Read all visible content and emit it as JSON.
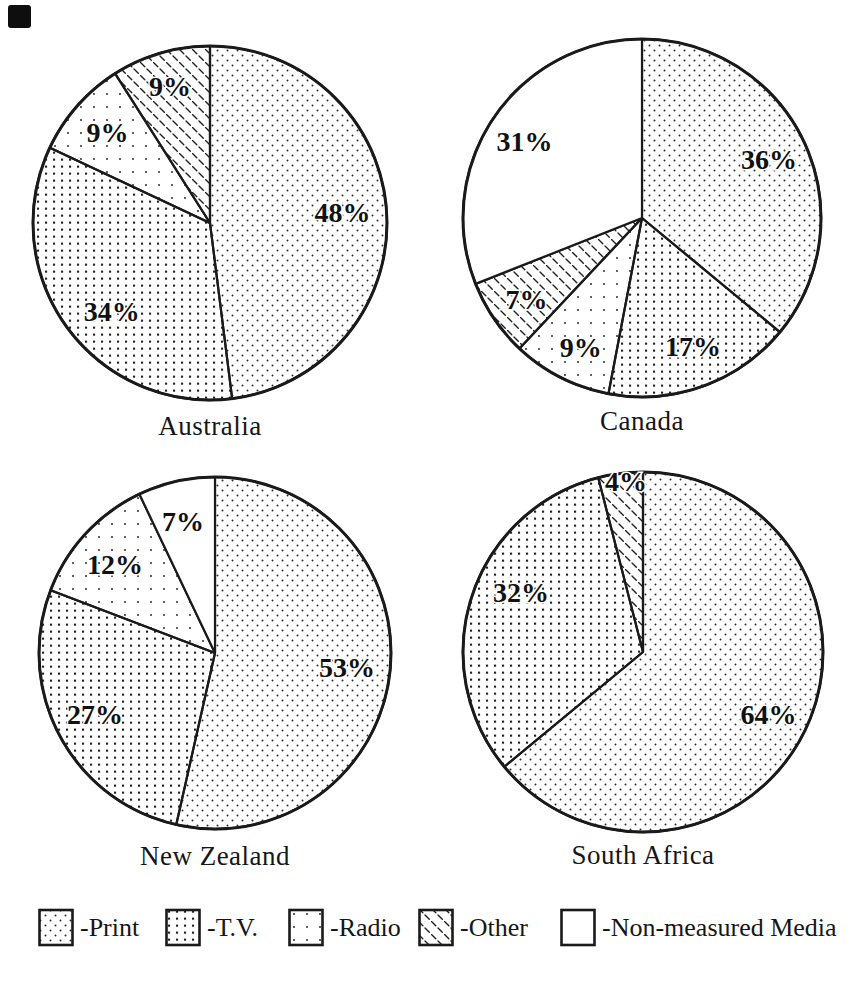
{
  "page": {
    "background": "#ffffff",
    "ink": "#1a1a1a"
  },
  "legend": {
    "items": [
      {
        "key": "print",
        "label": "-Print"
      },
      {
        "key": "tv",
        "label": "-T.V."
      },
      {
        "key": "radio",
        "label": "-Radio"
      },
      {
        "key": "other",
        "label": "-Other"
      },
      {
        "key": "nonmeasured",
        "label": "-Non-measured Media"
      }
    ]
  },
  "chart_data": [
    {
      "type": "pie",
      "title": "Australia",
      "start_angle_deg": 0,
      "direction": "clockwise",
      "layout": {
        "radius": 177
      },
      "slices": [
        {
          "series": "Print",
          "pattern": "print",
          "label": "48%",
          "value": 48,
          "label_angle": 85.7,
          "label_r": 0.75
        },
        {
          "series": "T.V.",
          "pattern": "tv",
          "label": "34%",
          "value": 34,
          "label_angle": 227.8,
          "label_r": 0.75
        },
        {
          "series": "Radio",
          "pattern": "radio",
          "label": "9%",
          "value": 9,
          "label_angle": 311.2,
          "label_r": 0.77
        },
        {
          "series": "Other",
          "pattern": "other",
          "label": "9%",
          "value": 9,
          "label_angle": 343.6,
          "label_r": 0.8
        }
      ]
    },
    {
      "type": "pie",
      "title": "Canada",
      "start_angle_deg": 0,
      "direction": "clockwise",
      "layout": {
        "radius": 179
      },
      "slices": [
        {
          "series": "Print",
          "pattern": "print",
          "label": "36%",
          "value": 36,
          "label_angle": 65.5,
          "label_r": 0.78
        },
        {
          "series": "T.V.",
          "pattern": "tv",
          "label": "17%",
          "value": 17,
          "label_angle": 158.4,
          "label_r": 0.775
        },
        {
          "series": "Radio",
          "pattern": "radio",
          "label": "9%",
          "value": 9,
          "label_angle": 205.3,
          "label_r": 0.8
        },
        {
          "series": "Other",
          "pattern": "other",
          "label": "7%",
          "value": 7,
          "label_angle": 234.7,
          "label_r": 0.79
        },
        {
          "series": "Non-measured Media",
          "pattern": "nonmeasured",
          "label": "31%",
          "value": 31,
          "label_angle": 302.8,
          "label_r": 0.78
        }
      ]
    },
    {
      "type": "pie",
      "title": "New Zealand",
      "start_angle_deg": 0,
      "direction": "clockwise",
      "layout": {
        "radius": 176
      },
      "slices": [
        {
          "series": "Print",
          "pattern": "print",
          "label": "53%",
          "value": 53,
          "label_angle": 96.5,
          "label_r": 0.755
        },
        {
          "series": "T.V.",
          "pattern": "tv",
          "label": "27%",
          "value": 27,
          "label_angle": 242.7,
          "label_r": 0.767
        },
        {
          "series": "Radio",
          "pattern": "radio",
          "label": "12%",
          "value": 12,
          "label_angle": 311.3,
          "label_r": 0.757
        },
        {
          "series": "Non-measured Media",
          "pattern": "nonmeasured",
          "label": "7%",
          "value": 7,
          "label_angle": 346.3,
          "label_r": 0.766
        }
      ]
    },
    {
      "type": "pie",
      "title": "South Africa",
      "start_angle_deg": 0,
      "direction": "clockwise",
      "layout": {
        "radius": 180
      },
      "slices": [
        {
          "series": "Print",
          "pattern": "print",
          "label": "64%",
          "value": 64,
          "label_angle": 116.6,
          "label_r": 0.78
        },
        {
          "series": "T.V.",
          "pattern": "tv",
          "label": "32%",
          "value": 32,
          "label_angle": 295.8,
          "label_r": 0.753
        },
        {
          "series": "Other",
          "pattern": "other",
          "label": "4%",
          "value": 4,
          "label_angle": 354.3,
          "label_r": 0.95
        }
      ]
    }
  ]
}
